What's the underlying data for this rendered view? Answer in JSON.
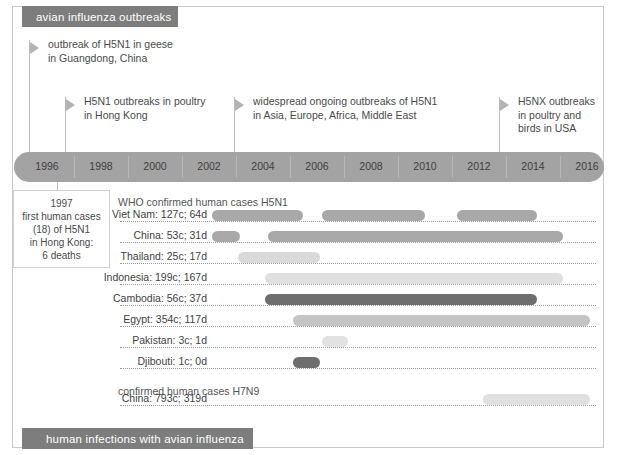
{
  "banners": {
    "top": "avian influenza outbreaks",
    "bottom": "human infections with avian influenza"
  },
  "events": [
    {
      "id": "h5n1-geese-guangdong",
      "text": "outbreak of H5N1 in geese\nin Guangdong, China",
      "x": 29,
      "flag_y": 42,
      "text_x": 48,
      "text_y": 42,
      "line_top": 40,
      "line_height": 112
    },
    {
      "id": "h5n1-poultry-hongkong",
      "text": "H5N1 outbreaks in poultry\nin Hong Kong",
      "x": 65,
      "flag_y": 99,
      "text_x": 84,
      "text_y": 99,
      "line_top": 97,
      "line_height": 55
    },
    {
      "id": "h5n1-widespread",
      "text": "widespread ongoing outbreaks of H5N1\nin Asia, Europe, Africa, Middle East",
      "x": 234,
      "flag_y": 99,
      "text_x": 253,
      "text_y": 99,
      "line_top": 97,
      "line_height": 55
    },
    {
      "id": "h5nx-usa",
      "text": "H5NX outbreaks\nin poultry and\nbirds in USA",
      "x": 499,
      "flag_y": 99,
      "text_x": 518,
      "text_y": 99,
      "line_top": 97,
      "line_height": 55
    }
  ],
  "callout": {
    "text": "1997\nfirst human cases\n(18) of H5N1\nin Hong Kong:\n6 deaths"
  },
  "chart_data": {
    "type": "bar",
    "title": "human infections with avian influenza",
    "xlabel": "",
    "ylabel": "",
    "grid": false,
    "legend": "none",
    "axis": {
      "ticks": [
        {
          "year": "1996",
          "x": 47
        },
        {
          "year": "1998",
          "x": 101
        },
        {
          "year": "2000",
          "x": 155
        },
        {
          "year": "2002",
          "x": 209
        },
        {
          "year": "2004",
          "x": 263
        },
        {
          "year": "2006",
          "x": 317
        },
        {
          "year": "2008",
          "x": 371
        },
        {
          "year": "2010",
          "x": 425
        },
        {
          "year": "2012",
          "x": 479
        },
        {
          "year": "2014",
          "x": 533
        },
        {
          "year": "2016",
          "x": 587
        }
      ],
      "separators": [
        74,
        128,
        182,
        236,
        290,
        344,
        398,
        452,
        506,
        560
      ]
    },
    "sections": [
      {
        "id": "h5n1",
        "heading": "WHO confirmed human cases H5N1",
        "heading_y": 196,
        "rows": [
          {
            "label": "Viet Nam: 127c; 64d",
            "cases": 127,
            "deaths": 64,
            "y": 214,
            "segments": [
              {
                "start_x": 212,
                "end_x": 303,
                "color": "#a8a8a8"
              },
              {
                "start_x": 322,
                "end_x": 425,
                "color": "#a8a8a8"
              },
              {
                "start_x": 457,
                "end_x": 537,
                "color": "#a8a8a8"
              }
            ]
          },
          {
            "label": "China: 53c; 31d",
            "cases": 53,
            "deaths": 31,
            "y": 235,
            "segments": [
              {
                "start_x": 212,
                "end_x": 240,
                "color": "#a8a8a8"
              },
              {
                "start_x": 268,
                "end_x": 563,
                "color": "#a8a8a8"
              }
            ]
          },
          {
            "label": "Thailand: 25c; 17d",
            "cases": 25,
            "deaths": 17,
            "y": 256,
            "segments": [
              {
                "start_x": 238,
                "end_x": 320,
                "color": "#d9d9d9"
              }
            ]
          },
          {
            "label": "Indonesia: 199c; 167d",
            "cases": 199,
            "deaths": 167,
            "y": 277,
            "segments": [
              {
                "start_x": 265,
                "end_x": 563,
                "color": "#dfdfdf"
              }
            ]
          },
          {
            "label": "Cambodia: 56c; 37d",
            "cases": 56,
            "deaths": 37,
            "y": 298,
            "segments": [
              {
                "start_x": 265,
                "end_x": 537,
                "color": "#6e6e6e"
              }
            ]
          },
          {
            "label": "Egypt: 354c; 117d",
            "cases": 354,
            "deaths": 117,
            "y": 319,
            "segments": [
              {
                "start_x": 293,
                "end_x": 590,
                "color": "#c4c4c4"
              }
            ]
          },
          {
            "label": "Pakistan: 3c; 1d",
            "cases": 3,
            "deaths": 1,
            "y": 340,
            "segments": [
              {
                "start_x": 322,
                "end_x": 348,
                "color": "#e2e2e2"
              }
            ]
          },
          {
            "label": "Djibouti: 1c; 0d",
            "cases": 1,
            "deaths": 0,
            "y": 361,
            "segments": [
              {
                "start_x": 293,
                "end_x": 320,
                "color": "#6e6e6e"
              }
            ]
          }
        ]
      },
      {
        "id": "h7n9",
        "heading": "confirmed human cases H7N9",
        "heading_y": 385,
        "rows": [
          {
            "label": "China: 793c; 319d",
            "cases": 793,
            "deaths": 319,
            "y": 398,
            "segments": [
              {
                "start_x": 483,
                "end_x": 590,
                "color": "#e0e0e0"
              }
            ]
          }
        ]
      }
    ]
  },
  "colors": {
    "banner": "#7d7d7d",
    "axis": "#a3a3a3",
    "bar_medium": "#a8a8a8",
    "bar_dark": "#6e6e6e",
    "bar_light": "#d9d9d9",
    "text": "#3f3f3f",
    "frame": "#c9c9c9"
  }
}
